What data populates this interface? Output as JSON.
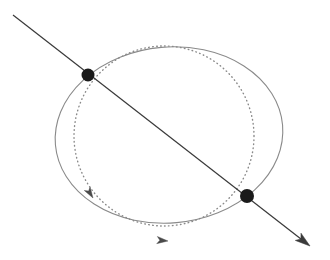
{
  "canvas": {
    "width": 330,
    "height": 260,
    "background": "#ffffff",
    "title": "Two intersecting closed curves crossed by a directed straight line"
  },
  "colors": {
    "line_stroke": "#3a3a3a",
    "ellipse_stroke": "#8a8a8a",
    "circle_stroke": "#8a8a8a",
    "node_fill": "#1a1a1a",
    "arrow_fill": "#3a3a3a",
    "background": "#ffffff"
  },
  "chart_data": {
    "type": "scatter",
    "title": "",
    "xlabel": "",
    "ylabel": "",
    "xlim": [
      0,
      330
    ],
    "ylim": [
      0,
      260
    ],
    "grid": false,
    "legend": null,
    "shapes": [
      {
        "name": "solid-ellipse",
        "kind": "ellipse",
        "style": "solid",
        "stroke": "#8a8a8a",
        "stroke_width": 1.1,
        "cx": 169,
        "cy": 135,
        "rx": 114,
        "ry": 88,
        "rotation_deg": -5,
        "directed": true,
        "arrow_at": {
          "x": 93,
          "y": 198,
          "angle_deg": 58
        }
      },
      {
        "name": "dotted-circle",
        "kind": "circle",
        "style": "dotted",
        "stroke": "#8a8a8a",
        "stroke_width": 1.4,
        "dash": "0.6 3.4",
        "cx": 164,
        "cy": 136,
        "r": 90,
        "directed": true,
        "arrow_at": {
          "x": 168,
          "y": 241,
          "angle_deg": 5
        }
      },
      {
        "name": "diagonal-line",
        "kind": "line",
        "style": "solid",
        "stroke": "#3a3a3a",
        "stroke_width": 1.2,
        "x1": 13,
        "y1": 15,
        "x2": 310,
        "y2": 246,
        "directed": true,
        "arrow_at": {
          "x": 310,
          "y": 246,
          "angle_deg": 37.9
        }
      }
    ],
    "points": [
      {
        "name": "upper-left-intersection",
        "x": 88,
        "y": 75,
        "r": 6.5,
        "fill": "#1a1a1a",
        "label": ""
      },
      {
        "name": "lower-right-intersection",
        "x": 247,
        "y": 196,
        "r": 7.0,
        "fill": "#1a1a1a",
        "label": ""
      }
    ],
    "annotations": []
  }
}
